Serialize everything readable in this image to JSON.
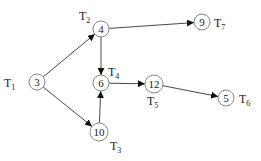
{
  "diagram": {
    "type": "task-graph",
    "nodes": [
      {
        "id": "n3",
        "value": "3",
        "task": "T",
        "sub": "1",
        "cx": 37,
        "cy": 82,
        "r": 8,
        "lx": 4,
        "ly": 87,
        "anchor": "start"
      },
      {
        "id": "n4",
        "value": "4",
        "task": "T",
        "sub": "2",
        "cx": 101,
        "cy": 29,
        "r": 8,
        "lx": 79,
        "ly": 20,
        "anchor": "start"
      },
      {
        "id": "n9",
        "value": "9",
        "task": "T",
        "sub": "7",
        "cx": 202,
        "cy": 22,
        "r": 8,
        "lx": 214,
        "ly": 27,
        "anchor": "start"
      },
      {
        "id": "n6",
        "value": "6",
        "task": "T",
        "sub": "4",
        "cx": 101,
        "cy": 83,
        "r": 8,
        "lx": 108,
        "ly": 76,
        "anchor": "start"
      },
      {
        "id": "n10",
        "value": "10",
        "task": "T",
        "sub": "3",
        "cx": 99,
        "cy": 132,
        "r": 9,
        "lx": 110,
        "ly": 150,
        "anchor": "start"
      },
      {
        "id": "n12",
        "value": "12",
        "task": "T",
        "sub": "5",
        "cx": 154,
        "cy": 84,
        "r": 9,
        "lx": 147,
        "ly": 105,
        "anchor": "start"
      },
      {
        "id": "n5",
        "value": "5",
        "task": "T",
        "sub": "6",
        "cx": 226,
        "cy": 98,
        "r": 8,
        "lx": 239,
        "ly": 103,
        "anchor": "start"
      }
    ],
    "edges": [
      {
        "from": "n3",
        "to": "n4"
      },
      {
        "from": "n3",
        "to": "n10"
      },
      {
        "from": "n4",
        "to": "n9"
      },
      {
        "from": "n4",
        "to": "n6"
      },
      {
        "from": "n10",
        "to": "n6"
      },
      {
        "from": "n6",
        "to": "n12"
      },
      {
        "from": "n12",
        "to": "n5"
      }
    ]
  }
}
